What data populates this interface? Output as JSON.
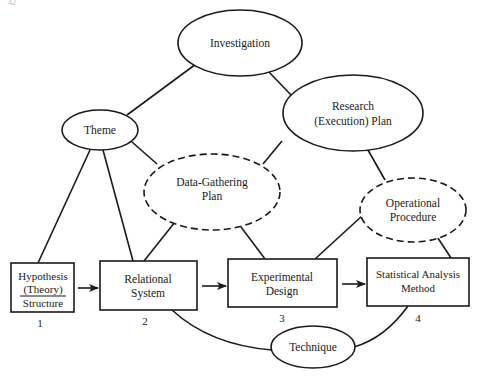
{
  "page": {
    "page_marker": "42"
  },
  "nodes": {
    "investigation": {
      "label": "Investigation",
      "shape": "ellipse",
      "border": "solid"
    },
    "theme": {
      "label": "Theme",
      "shape": "ellipse",
      "border": "solid"
    },
    "research_plan": {
      "line1": "Research",
      "line2": "(Execution) Plan",
      "shape": "ellipse",
      "border": "solid"
    },
    "data_gathering_plan": {
      "line1": "Data-Gathering",
      "line2": "Plan",
      "shape": "ellipse",
      "border": "dashed"
    },
    "operational_procedure": {
      "line1": "Operational",
      "line2": "Procedure",
      "shape": "ellipse",
      "border": "dashed"
    },
    "technique": {
      "label": "Technique",
      "shape": "ellipse",
      "border": "solid"
    },
    "hypothesis": {
      "line1": "Hypothesis",
      "line2": "(Theory)",
      "line3": "Structure",
      "number": "1",
      "shape": "box"
    },
    "relational_system": {
      "line1": "Relational",
      "line2": "System",
      "number": "2",
      "shape": "box"
    },
    "experimental_design": {
      "line1": "Experimental",
      "line2": "Design",
      "number": "3",
      "shape": "box"
    },
    "statistical_analysis": {
      "line1": "Statistical Analysis",
      "line2": "Method",
      "number": "4",
      "shape": "box"
    }
  },
  "edges": [
    {
      "from": "Investigation",
      "to": "Theme",
      "type": "line"
    },
    {
      "from": "Investigation",
      "to": "Research (Execution) Plan",
      "type": "line"
    },
    {
      "from": "Theme",
      "to": "Hypothesis (Theory) Structure",
      "type": "line"
    },
    {
      "from": "Theme",
      "to": "Relational System",
      "type": "line"
    },
    {
      "from": "Theme",
      "to": "Data-Gathering Plan",
      "type": "line"
    },
    {
      "from": "Research (Execution) Plan",
      "to": "Data-Gathering Plan",
      "type": "line"
    },
    {
      "from": "Research (Execution) Plan",
      "to": "Operational Procedure",
      "type": "line"
    },
    {
      "from": "Data-Gathering Plan",
      "to": "Relational System",
      "type": "line"
    },
    {
      "from": "Data-Gathering Plan",
      "to": "Experimental Design",
      "type": "line"
    },
    {
      "from": "Operational Procedure",
      "to": "Experimental Design",
      "type": "line"
    },
    {
      "from": "Operational Procedure",
      "to": "Statistical Analysis Method",
      "type": "line"
    },
    {
      "from": "Hypothesis (Theory) Structure",
      "to": "Relational System",
      "type": "arrow"
    },
    {
      "from": "Relational System",
      "to": "Experimental Design",
      "type": "arrow"
    },
    {
      "from": "Experimental Design",
      "to": "Statistical Analysis Method",
      "type": "arrow"
    },
    {
      "from": "Relational System",
      "to": "Technique",
      "type": "curve"
    },
    {
      "from": "Statistical Analysis Method",
      "to": "Technique",
      "type": "curve"
    }
  ],
  "colors": {
    "ink": "#1a1a1a",
    "paper": "#ffffff"
  }
}
